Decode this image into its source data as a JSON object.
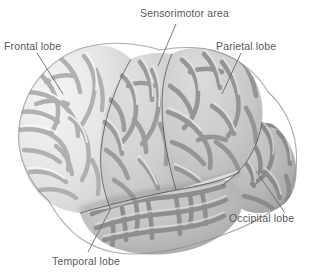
{
  "figure": {
    "view": "left lateral",
    "background_color": "#ffffff",
    "leader_line_color": "#6b6b6d",
    "label_text_color": "#58585a"
  },
  "labels": {
    "frontal": "Frontal lobe",
    "sensorimotor": "Sensorimotor area",
    "parietal": "Parietal lobe",
    "occipital": "Occipital lobe",
    "temporal": "Temporal lobe"
  },
  "regions": [
    {
      "key": "frontal",
      "name": "Frontal lobe",
      "gyri_color": "#e9e9e9",
      "sulci_color": "#b3b3b3",
      "shade": "lightest"
    },
    {
      "key": "sensorimotor",
      "name": "Sensorimotor area",
      "gyri_color": "#d2d2d2",
      "sulci_color": "#9e9e9e",
      "shade": "light-medium"
    },
    {
      "key": "parietal",
      "name": "Parietal lobe",
      "gyri_color": "#cccccc",
      "sulci_color": "#979797",
      "shade": "medium"
    },
    {
      "key": "occipital",
      "name": "Occipital lobe",
      "gyri_color": "#b9b9b9",
      "sulci_color": "#8e8e8e",
      "shade": "medium-dark"
    },
    {
      "key": "temporal",
      "name": "Temporal lobe",
      "gyri_color": "#bdbdbd",
      "sulci_color": "#909090",
      "shade": "medium-dark"
    }
  ],
  "leader_lines": [
    {
      "key": "frontal",
      "from_x": 37,
      "from_y": 53,
      "to_x": 63,
      "to_y": 94
    },
    {
      "key": "sensorimotor",
      "from_x": 176,
      "from_y": 24,
      "to_x": 158,
      "to_y": 66
    },
    {
      "key": "parietal",
      "from_x": 241,
      "from_y": 53,
      "to_x": 222,
      "to_y": 94
    },
    {
      "key": "occipital",
      "from_x": 256,
      "from_y": 171,
      "to_x": 285,
      "to_y": 213
    },
    {
      "key": "temporal",
      "from_x": 111,
      "from_y": 208,
      "to_x": 88,
      "to_y": 252
    }
  ]
}
